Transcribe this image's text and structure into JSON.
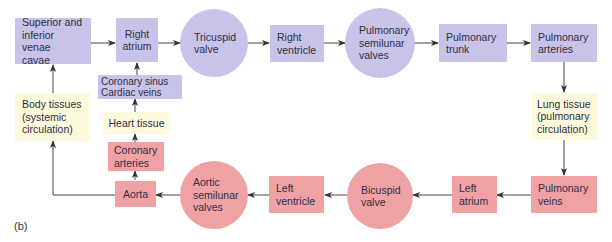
{
  "figure": {
    "label": "(b)",
    "colors": {
      "deoxygenated": "#c8c3e8",
      "oxygenated": "#efa1a3",
      "tissue": "#fdf9dc",
      "arrow": "#333333"
    },
    "nodes": {
      "venae_cavae": "Superior and\ninferior venae\ncavae",
      "right_atrium": "Right\natrium",
      "tricuspid": "Tricuspid\nvalve",
      "right_ventricle": "Right\nventricle",
      "pulm_semilunar": "Pulmonary\nsemilunar\nvalves",
      "pulm_trunk": "Pulmonary\ntrunk",
      "pulm_arteries": "Pulmonary\narteries",
      "lung_tissue": "Lung tissue\n(pulmonary\ncirculation)",
      "pulm_veins": "Pulmonary\nveins",
      "left_atrium": "Left\natrium",
      "bicuspid": "Bicuspid\nvalve",
      "left_ventricle": "Left\nventricle",
      "aortic_semilunar": "Aortic\nsemilunar\nvalves",
      "aorta": "Aorta",
      "coronary_arteries": "Coronary\narteries",
      "heart_tissue": "Heart tissue",
      "coronary_sinus": "Coronary sinus\nCardiac veins",
      "body_tissues": "Body tissues\n(systemic\ncirculation)"
    }
  }
}
